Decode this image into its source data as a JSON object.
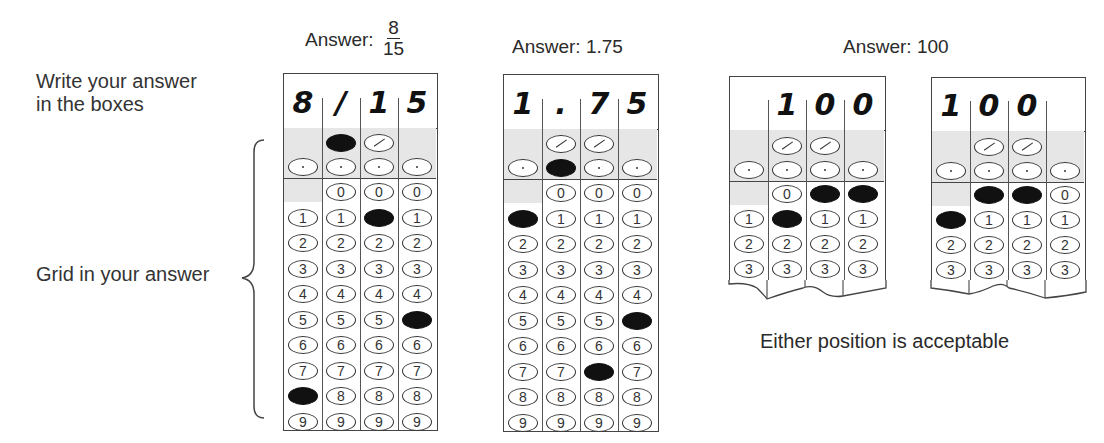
{
  "instructions": {
    "write_label_line1": "Write your answer",
    "write_label_line2": "in the boxes",
    "grid_label": "Grid in your answer",
    "either_position": "Either position is acceptable"
  },
  "examples": [
    {
      "title_prefix": "Answer:",
      "title_fraction_num": "8",
      "title_fraction_den": "15",
      "written": [
        "8",
        "/",
        "1",
        "5"
      ],
      "bubbles": {
        "slash_row": [
          "",
          "filled",
          "empty",
          ""
        ],
        "decimal_row": [
          "empty",
          "empty",
          "empty",
          "empty"
        ],
        "digit_filled": [
          "8",
          "",
          "1",
          "5"
        ]
      }
    },
    {
      "title": "Answer: 1.75",
      "written": [
        "1",
        ".",
        "7",
        "5"
      ],
      "bubbles": {
        "slash_row": [
          "",
          "empty",
          "empty",
          ""
        ],
        "decimal_row": [
          "empty",
          "filled",
          "empty",
          "empty"
        ],
        "digit_filled": [
          "1",
          "",
          "7",
          "5"
        ]
      }
    },
    {
      "title": "Answer: 100",
      "variant": "right-aligned",
      "written": [
        "",
        "1",
        "0",
        "0"
      ],
      "bubbles": {
        "digit_filled": [
          "1",
          "1",
          "0",
          "0"
        ],
        "note": "first column digit 1 empty; columns 2-4 show 1,0,0 filled"
      }
    },
    {
      "variant": "left-aligned",
      "written": [
        "1",
        "0",
        "0",
        ""
      ],
      "bubbles": {
        "digit_filled": [
          "1",
          "0",
          "0",
          ""
        ]
      }
    }
  ],
  "digits": [
    "0",
    "1",
    "2",
    "3",
    "4",
    "5",
    "6",
    "7",
    "8",
    "9"
  ],
  "colors": {
    "ink": "#111111",
    "shade": "#e6e6e6",
    "border": "#444444"
  }
}
